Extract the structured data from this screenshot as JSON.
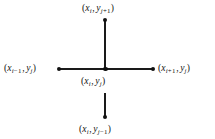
{
  "figure": {
    "name": "five-point-finite-difference-stencil",
    "background_color": "#ffffff",
    "ink_color": "#111111",
    "width": 215,
    "height": 139
  },
  "nodes": {
    "top": {
      "label_open": "(",
      "x_var": "x",
      "x_sub": "i",
      "comma": ",",
      "y_var": "y",
      "y_sub_base": "j",
      "y_sub_op": "+",
      "y_sub_offset": "1",
      "label_close": ")",
      "label_plain": "(x_i, y_j+1)"
    },
    "left": {
      "label_open": "(",
      "x_var": "x",
      "x_sub_base": "i",
      "x_sub_op": "−",
      "x_sub_offset": "1",
      "comma": ",",
      "y_var": "y",
      "y_sub": "j",
      "label_close": ")",
      "label_plain": "(x_i−1, y_j)"
    },
    "center": {
      "label_open": "(",
      "x_var": "x",
      "x_sub": "i",
      "comma": ",",
      "y_var": "y",
      "y_sub": "j",
      "label_close": ")",
      "label_plain": "(x_i, y_j)"
    },
    "right": {
      "label_open": "(",
      "x_var": "x",
      "x_sub_base": "i",
      "x_sub_op": "+",
      "x_sub_offset": "1",
      "comma": ",",
      "y_var": "y",
      "y_sub": "j",
      "label_close": ")",
      "label_plain": "(x_i+1, y_j)"
    },
    "bottom": {
      "label_open": "(",
      "x_var": "x",
      "x_sub": "i",
      "comma": ",",
      "y_var": "y",
      "y_sub_base": "j",
      "y_sub_op": "−",
      "y_sub_offset": "1",
      "label_close": ")",
      "label_plain": "(x_i, y_j−1)"
    }
  }
}
